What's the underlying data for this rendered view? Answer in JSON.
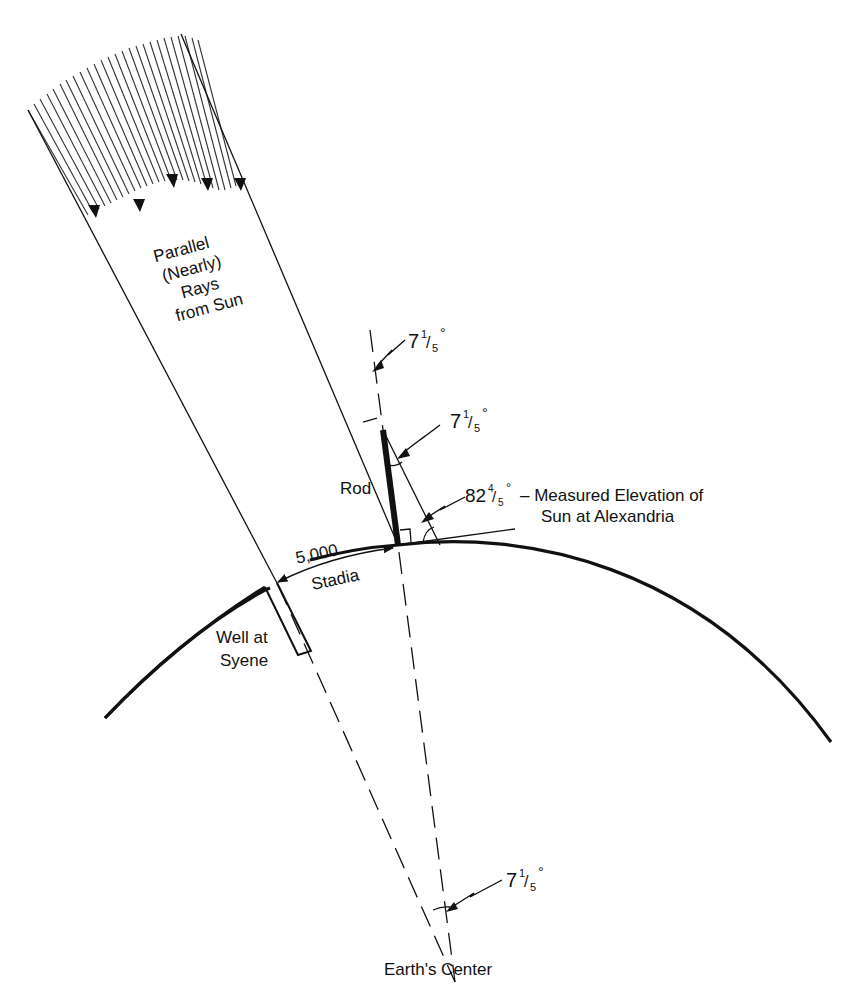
{
  "figure": {
    "colors": {
      "ink": "#111111",
      "background": "#ffffff"
    }
  },
  "labels": {
    "sun_rays": [
      "Parallel",
      "(Nearly)",
      "Rays",
      "from Sun"
    ],
    "rod": "Rod",
    "distance_value": "5,000",
    "distance_unit": "Stadia",
    "well": [
      "Well at",
      "Syene"
    ],
    "elevation_desc": [
      "– Measured Elevation of",
      "Sun at Alexandria"
    ],
    "earth_center": "Earth's Center"
  },
  "angles": {
    "top_ray": {
      "whole": "7",
      "num": "1",
      "den": "5",
      "deg": "°"
    },
    "rod_shadow": {
      "whole": "7",
      "num": "1",
      "den": "5",
      "deg": "°"
    },
    "elevation": {
      "whole": "82",
      "num": "4",
      "den": "5",
      "deg": "°"
    },
    "center": {
      "whole": "7",
      "num": "1",
      "den": "5",
      "deg": "°"
    }
  }
}
